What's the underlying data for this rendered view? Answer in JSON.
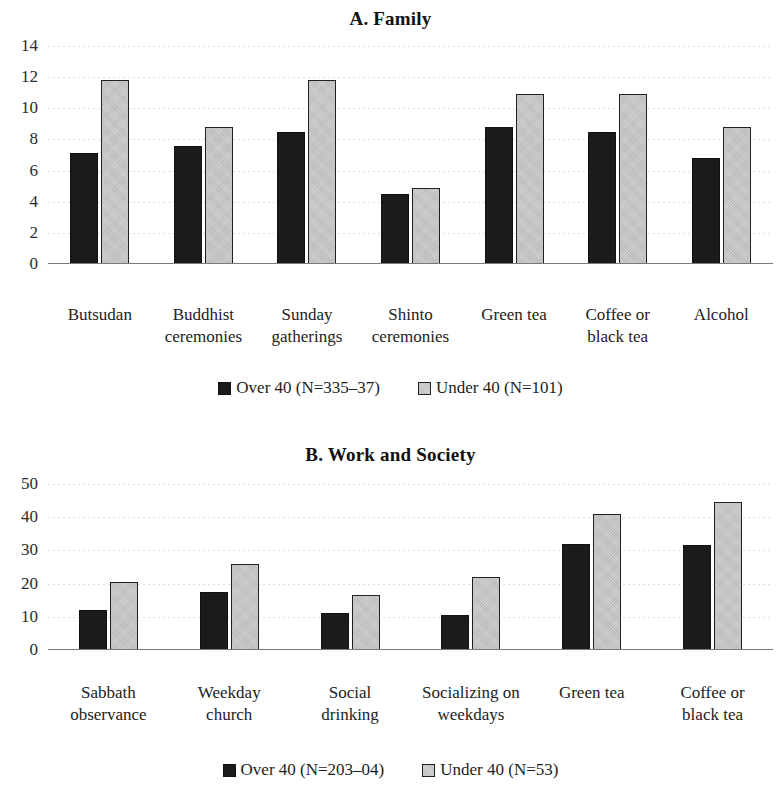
{
  "figure": {
    "panels": [
      {
        "id": "panel-a",
        "title": "A. Family",
        "legend": {
          "series_a_label": "Over 40 (N=335–37)",
          "series_b_label": "Under 40 (N=101)"
        }
      },
      {
        "id": "panel-b",
        "title": "B. Work and Society",
        "legend": {
          "series_a_label": "Over 40 (N=203–04)",
          "series_b_label": "Under 40 (N=53)"
        }
      }
    ]
  },
  "colors": {
    "series_over_40": "#1b1b1b",
    "series_under_40": "#d2d2d2",
    "bar_outline": "#202020",
    "gridline": "#d8d8d8",
    "baseline": "#7a7a7a",
    "text": "#1a1a1a",
    "background": "#ffffff"
  },
  "chart_data": [
    {
      "type": "bar",
      "title": "A. Family",
      "xlabel": "",
      "ylabel": "",
      "ylim": [
        0,
        14
      ],
      "yticks": [
        0,
        2,
        4,
        6,
        8,
        10,
        12,
        14
      ],
      "ytick_labels": [
        "0",
        "2",
        "4",
        "6",
        "8",
        "10",
        "12",
        "14"
      ],
      "grid": true,
      "legend_position": "bottom",
      "categories": [
        "Butsudan",
        "Buddhist ceremonies",
        "Sunday gatherings",
        "Shinto ceremonies",
        "Green tea",
        "Coffee or black tea",
        "Alcohol"
      ],
      "category_lines": [
        [
          "Butsudan",
          ""
        ],
        [
          "Buddhist",
          "ceremonies"
        ],
        [
          "Sunday",
          "gatherings"
        ],
        [
          "Shinto",
          "ceremonies"
        ],
        [
          "Green tea",
          ""
        ],
        [
          "Coffee or",
          "black tea"
        ],
        [
          "Alcohol",
          ""
        ]
      ],
      "series": [
        {
          "name": "Over 40 (N=335–37)",
          "color": "#1b1b1b",
          "values": [
            7.1,
            7.6,
            8.5,
            4.5,
            8.8,
            8.5,
            6.8
          ]
        },
        {
          "name": "Under 40 (N=101)",
          "color": "#d2d2d2",
          "values": [
            11.8,
            8.8,
            11.8,
            4.9,
            10.9,
            10.9,
            8.8
          ]
        }
      ]
    },
    {
      "type": "bar",
      "title": "B. Work and Society",
      "xlabel": "",
      "ylabel": "",
      "ylim": [
        0,
        50
      ],
      "yticks": [
        0,
        10,
        20,
        30,
        40,
        50
      ],
      "ytick_labels": [
        "0",
        "10",
        "20",
        "30",
        "40",
        "50"
      ],
      "grid": true,
      "legend_position": "bottom",
      "categories": [
        "Sabbath observance",
        "Weekday church",
        "Social drinking",
        "Socializing on weekdays",
        "Green tea",
        "Coffee or black tea"
      ],
      "category_lines": [
        [
          "Sabbath",
          "observance"
        ],
        [
          "Weekday",
          "church"
        ],
        [
          "Social",
          "drinking"
        ],
        [
          "Socializing on",
          "weekdays"
        ],
        [
          "Green tea",
          ""
        ],
        [
          "Coffee or",
          "black tea"
        ]
      ],
      "series": [
        {
          "name": "Over 40 (N=203–04)",
          "color": "#1b1b1b",
          "values": [
            12,
            17.5,
            11,
            10.5,
            32,
            31.5
          ]
        },
        {
          "name": "Under 40 (N=53)",
          "color": "#d2d2d2",
          "values": [
            20.5,
            26,
            16.5,
            22,
            41,
            44.5
          ]
        }
      ]
    }
  ]
}
